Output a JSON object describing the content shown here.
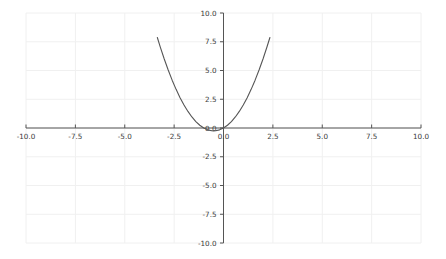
{
  "chart_data": {
    "type": "line",
    "title": "",
    "subtitle": "",
    "xlabel": "",
    "ylabel": "",
    "xlim": [
      -10.0,
      10.0
    ],
    "ylim": [
      -10.0,
      10.0
    ],
    "grid": true,
    "legend": null,
    "legend_position": "none",
    "axis_style": "spines-at-zero",
    "xticks": [
      -10.0,
      -7.5,
      -5.0,
      -2.5,
      0.0,
      2.5,
      5.0,
      7.5,
      10.0
    ],
    "xtick_labels": [
      "-10.0",
      "-7.5",
      "-5.0",
      "-2.5",
      "0.0",
      "2.5",
      "5.0",
      "7.5",
      "10.0"
    ],
    "yticks": [
      -10.0,
      -7.5,
      -5.0,
      -2.5,
      0.0,
      2.5,
      5.0,
      7.5,
      10.0
    ],
    "ytick_labels": [
      "-10.0",
      "-7.5",
      "-5.0",
      "-2.5",
      "0.0",
      "2.5",
      "5.0",
      "7.5",
      "10.0"
    ],
    "series": [
      {
        "name": "y = x^2 + x",
        "type": "line",
        "color": "#555555",
        "linewidth": 1.1,
        "x": [
          -3.35,
          -3.2,
          -3.0,
          -2.8,
          -2.6,
          -2.4,
          -2.2,
          -2.0,
          -1.8,
          -1.6,
          -1.4,
          -1.2,
          -1.0,
          -0.8,
          -0.6,
          -0.5,
          -0.4,
          -0.2,
          0.0,
          0.2,
          0.4,
          0.6,
          0.8,
          1.0,
          1.2,
          1.4,
          1.6,
          1.8,
          2.0,
          2.2,
          2.35
        ],
        "y": [
          7.87,
          7.04,
          6.0,
          5.04,
          4.16,
          3.36,
          2.64,
          2.0,
          1.44,
          0.96,
          0.56,
          0.24,
          0.0,
          -0.16,
          -0.24,
          -0.25,
          -0.24,
          -0.16,
          0.0,
          0.24,
          0.56,
          0.96,
          1.44,
          2.0,
          2.64,
          3.36,
          4.16,
          5.04,
          6.0,
          7.04,
          7.87
        ]
      }
    ],
    "annotations": [],
    "colors": {
      "curve": "#555555",
      "axis": "#555555",
      "grid": "#f0f0f0",
      "tick_text": "#3a3a3a",
      "background": "#ffffff"
    }
  }
}
